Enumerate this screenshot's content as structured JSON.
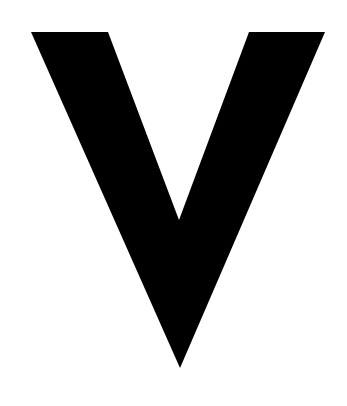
{
  "image": {
    "description": "Large black letter V on white background",
    "glyph": "V",
    "background_color": "#ffffff",
    "glyph_color": "#000000",
    "polygon": [
      [
        31,
        32
      ],
      [
        108,
        32
      ],
      [
        179,
        220
      ],
      [
        249,
        32
      ],
      [
        325,
        32
      ],
      [
        180,
        368
      ]
    ]
  }
}
